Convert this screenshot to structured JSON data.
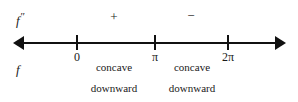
{
  "figure": {
    "type": "sign-chart",
    "background_color": "#ffffff",
    "ink_color": "#111111"
  },
  "rows": {
    "second_derivative": {
      "label_base": "f",
      "label_prime": "″",
      "label_full": "f″"
    },
    "function": {
      "label_base": "f",
      "label_full": "f"
    }
  },
  "signs": [
    {
      "symbol": "+",
      "interval": "(0, π)"
    },
    {
      "symbol": "−",
      "interval": "(π, 2π)"
    }
  ],
  "number_line": {
    "left_arrow": "◀",
    "right_arrow": "▶",
    "ticks": [
      {
        "label": "0",
        "value": 0
      },
      {
        "label": "π",
        "value": 3.14159
      },
      {
        "label": "2π",
        "value": 6.28319
      }
    ]
  },
  "concavity": [
    {
      "line1": "concave",
      "line2": "downward",
      "interval": "(0, π)"
    },
    {
      "line1": "concave",
      "line2": "downward",
      "interval": "(π, 2π)"
    }
  ]
}
